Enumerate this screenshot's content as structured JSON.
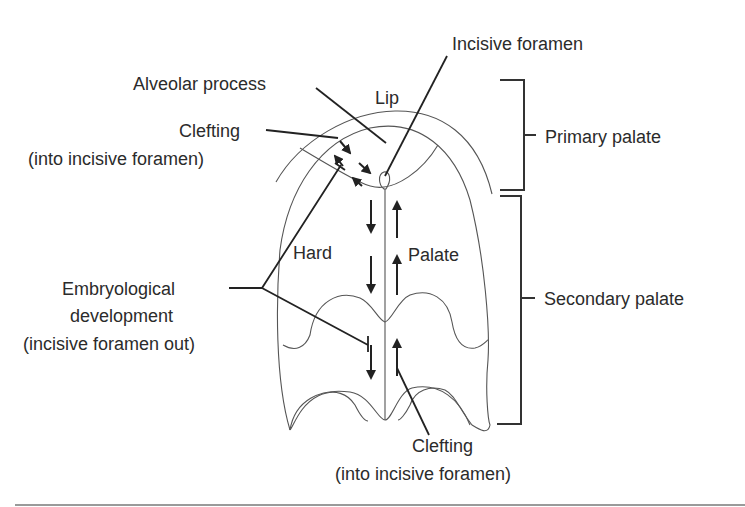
{
  "figure": {
    "labels": {
      "incisive_foramen": "Incisive  foramen",
      "alveolar_process": "Alveolar process",
      "lip": "Lip",
      "clefting_top_line1": "Clefting",
      "clefting_top_line2": "(into incisive foramen)",
      "primary_palate": "Primary palate",
      "hard": "Hard",
      "palate": "Palate",
      "embryological_line1": "Embryological",
      "embryological_line2": "development",
      "embryological_line3": "(incisive foramen out)",
      "secondary_palate": "Secondary palate",
      "clefting_bottom_line1": "Clefting",
      "clefting_bottom_line2": "(into incisive foramen)"
    },
    "colors": {
      "outline": "#555555",
      "leader": "#222222",
      "text": "#2b2b2b"
    }
  }
}
